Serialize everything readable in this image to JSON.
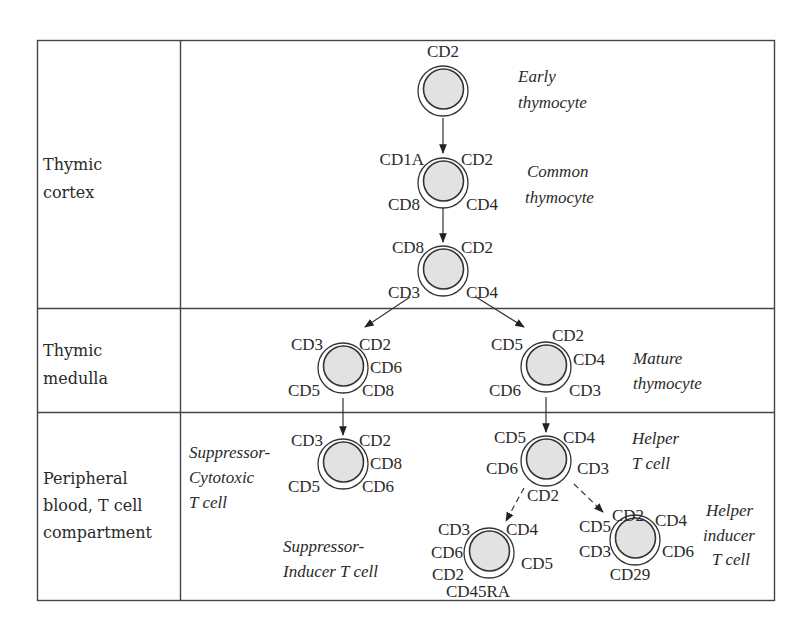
{
  "figure": {
    "rows": [
      {
        "label_lines": [
          "Thymic",
          "cortex"
        ]
      },
      {
        "label_lines": [
          "Thymic",
          "medulla"
        ]
      },
      {
        "label_lines": [
          "Peripheral",
          "blood, T cell",
          "compartment"
        ]
      }
    ],
    "cells": {
      "early": {
        "markers": [
          "CD2"
        ],
        "description": [
          "Early",
          "thymocyte"
        ]
      },
      "common": {
        "markers": [
          "CD1A",
          "CD2",
          "CD8",
          "CD4"
        ],
        "description": [
          "Common",
          "thymocyte"
        ]
      },
      "cortex3": {
        "markers": [
          "CD8",
          "CD2",
          "CD3",
          "CD4"
        ]
      },
      "medulla_left": {
        "markers": [
          "CD3",
          "CD2",
          "CD6",
          "CD5",
          "CD8"
        ]
      },
      "medulla_right": {
        "markers": [
          "CD5",
          "CD2",
          "CD4",
          "CD6",
          "CD3"
        ],
        "description": [
          "Mature",
          "thymocyte"
        ]
      },
      "suppressor_cytotoxic": {
        "markers": [
          "CD3",
          "CD2",
          "CD8",
          "CD5",
          "CD6"
        ],
        "description": [
          "Suppressor-",
          "Cytotoxic",
          "T cell"
        ]
      },
      "helper": {
        "markers": [
          "CD5",
          "CD4",
          "CD6",
          "CD3",
          "CD2"
        ],
        "description": [
          "Helper",
          "T cell"
        ]
      },
      "suppressor_inducer": {
        "markers": [
          "CD3",
          "CD4",
          "CD6",
          "CD5",
          "CD2",
          "CD45RA"
        ],
        "description": [
          "Suppressor-",
          "Inducer T cell"
        ]
      },
      "helper_inducer": {
        "markers": [
          "CD2",
          "CD4",
          "CD5",
          "CD3",
          "CD6",
          "CD29"
        ],
        "description": [
          "Helper",
          "inducer",
          "T cell"
        ]
      }
    },
    "colors": {
      "cell_fill": "#e2e2e2",
      "stroke": "#333333",
      "background": "#ffffff"
    }
  }
}
